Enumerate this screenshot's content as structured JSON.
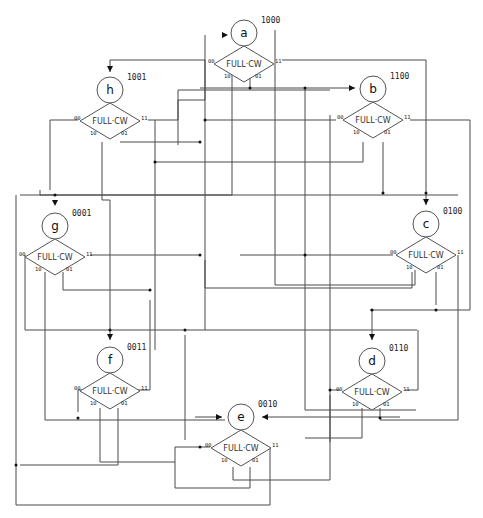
{
  "diagram": {
    "type": "state-machine-flowchart",
    "condition_label": "FULL·CW",
    "port_labels": {
      "left": "00",
      "right": "11",
      "bottom_left": "10",
      "bottom_right": "01"
    },
    "states": [
      {
        "id": "a",
        "letter": "a",
        "code": "1000",
        "cx": 244,
        "cy": 33
      },
      {
        "id": "h",
        "letter": "h",
        "code": "1001",
        "cx": 110,
        "cy": 90
      },
      {
        "id": "b",
        "letter": "b",
        "code": "1100",
        "cx": 373,
        "cy": 89
      },
      {
        "id": "g",
        "letter": "g",
        "code": "0001",
        "cx": 55,
        "cy": 226
      },
      {
        "id": "c",
        "letter": "c",
        "code": "0100",
        "cx": 426,
        "cy": 224
      },
      {
        "id": "f",
        "letter": "f",
        "code": "0011",
        "cx": 110,
        "cy": 360
      },
      {
        "id": "d",
        "letter": "d",
        "code": "0110",
        "cx": 372,
        "cy": 361
      },
      {
        "id": "e",
        "letter": "e",
        "code": "0010",
        "cx": 241,
        "cy": 417
      }
    ]
  }
}
